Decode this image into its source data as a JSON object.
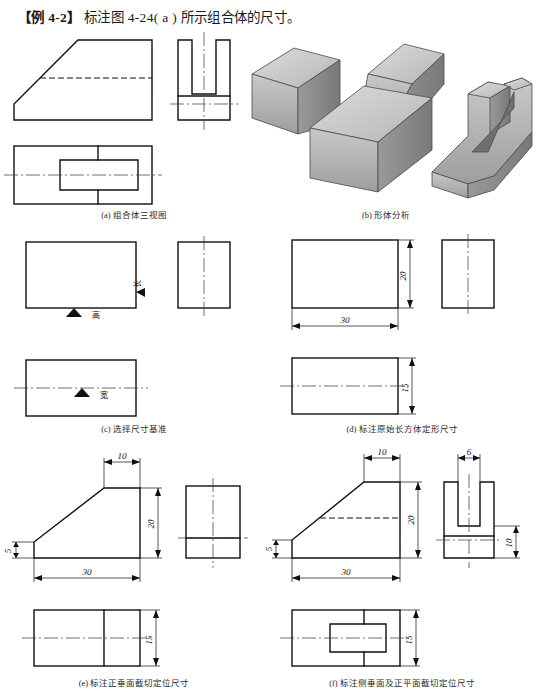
{
  "title": {
    "example_tag": "【例 4-2】",
    "text": "标注图 4-24( a ) 所示组合体的尺寸。"
  },
  "panels": [
    {
      "id": "a",
      "caption": "(a) 组合体三视图"
    },
    {
      "id": "b",
      "caption": "(b) 形体分析"
    },
    {
      "id": "c",
      "caption": "(c) 选择尺寸基准"
    },
    {
      "id": "d",
      "caption": "(d) 标注原始长方体定形尺寸"
    },
    {
      "id": "e",
      "caption": "(e) 标注正垂面截切定位尺寸"
    },
    {
      "id": "f",
      "caption": "(f) 标注侧垂面及正平面截切定位尺寸"
    }
  ],
  "datum_labels": {
    "length": "长",
    "height": "高",
    "width": "宽"
  },
  "dimensions": {
    "d": {
      "length": "30",
      "height": "20",
      "width": "15"
    },
    "e": {
      "top_length": "10",
      "height": "20",
      "left_height": "5",
      "length": "30",
      "width": "15"
    },
    "f": {
      "top_length": "10",
      "height": "20",
      "left_height": "5",
      "length": "30",
      "slot_width": "6",
      "slot_depth": "10",
      "width": "15"
    }
  },
  "colors": {
    "line": "#111111",
    "page_bg": "#ffffff",
    "solid_light": "#d8d8d8",
    "solid_mid": "#b4b4b4",
    "solid_dark": "#8d8d8d",
    "solid_darker": "#6f6f6f"
  }
}
